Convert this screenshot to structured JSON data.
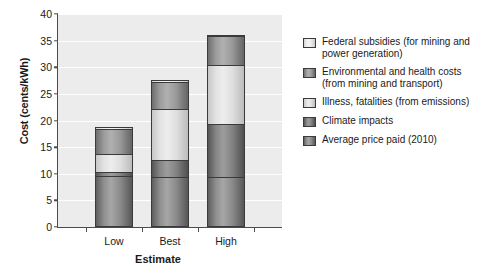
{
  "chart_data": {
    "type": "bar",
    "subtype": "stacked-bar",
    "title": "",
    "xlabel": "Estimate",
    "ylabel": "Cost (cents/kWh)",
    "categories": [
      "Low",
      "Best",
      "High"
    ],
    "ylim": [
      0,
      40
    ],
    "yticks": [
      0,
      5,
      10,
      15,
      20,
      25,
      30,
      35,
      40
    ],
    "grid": "horizontal",
    "legend_position": "right",
    "stack_order_bottom_to_top": [
      "Average price paid (2010)",
      "Climate impacts",
      "Illness, fatalities (from emissions)",
      "Environmental and health costs (from mining and transport)",
      "Federal subsidies (for mining and power generation)"
    ],
    "series": [
      {
        "name": "Average price paid (2010)",
        "values": [
          9.5,
          9.4,
          9.3
        ],
        "color": "#a6a6a6"
      },
      {
        "name": "Climate impacts",
        "values": [
          0.9,
          3.1,
          10.1
        ],
        "color": "#9d9d9d"
      },
      {
        "name": "Illness, fatalities (from emissions)",
        "values": [
          3.3,
          9.6,
          11.1
        ],
        "color": "#ededed"
      },
      {
        "name": "Environmental and health costs (from mining and transport)",
        "values": [
          4.8,
          5.1,
          5.4
        ],
        "color": "#b0b0b0"
      },
      {
        "name": "Federal subsidies (for mining and power generation)",
        "values": [
          0.2,
          0.5,
          0.2
        ],
        "color": "#f6f6f6"
      }
    ],
    "cumulative_tops": {
      "Low": [
        9.5,
        10.4,
        13.7,
        18.5,
        18.7
      ],
      "Best": [
        9.4,
        12.5,
        22.1,
        27.2,
        27.7
      ],
      "High": [
        9.3,
        19.4,
        30.5,
        35.9,
        36.1
      ]
    },
    "totals": [
      18.7,
      27.7,
      36.1
    ]
  },
  "legend": {
    "items": [
      {
        "label": "Federal subsidies (for mining and power generation)",
        "swatch_class": "c-subsidy"
      },
      {
        "label": "Environmental and health costs (from mining and transport)",
        "swatch_class": "c-envhealth"
      },
      {
        "label": "Illness, fatalities (from emissions)",
        "swatch_class": "c-illness"
      },
      {
        "label": "Climate impacts",
        "swatch_class": "c-climate"
      },
      {
        "label": "Average price paid (2010)",
        "swatch_class": "c-avg"
      }
    ]
  },
  "axes": {
    "y_title": "Cost (cents/kWh)",
    "x_title": "Estimate",
    "y_ticks": [
      "0",
      "5",
      "10",
      "15",
      "20",
      "25",
      "30",
      "35",
      "40"
    ],
    "x_ticks": [
      "Low",
      "Best",
      "High"
    ]
  }
}
